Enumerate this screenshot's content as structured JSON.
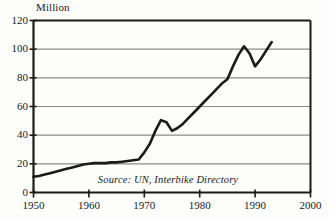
{
  "chart_data": {
    "type": "line",
    "title": "",
    "subtitle": "",
    "xlabel": "",
    "ylabel": "Million",
    "unit_label": "Million",
    "xlim": [
      1950,
      2000
    ],
    "ylim": [
      0,
      120
    ],
    "grid": true,
    "gridlines": "horizontal",
    "legend": "none",
    "legend_position": "none",
    "x_ticks": [
      "1950",
      "1960",
      "1970",
      "1980",
      "1990",
      "2000"
    ],
    "x_tick_values": [
      1950,
      1960,
      1970,
      1980,
      1990,
      2000
    ],
    "y_ticks": [
      "0",
      "20",
      "40",
      "60",
      "80",
      "100",
      "120"
    ],
    "y_tick_values": [
      0,
      20,
      40,
      60,
      80,
      100,
      120
    ],
    "annotations": [
      {
        "name": "source-note",
        "text": "Source: UN, Interbike Directory",
        "x": 1977.5,
        "y": 8
      }
    ],
    "series": [
      {
        "name": "World Bicycle Production",
        "color": "#1a1a1a",
        "x": [
          1950,
          1951,
          1952,
          1953,
          1954,
          1955,
          1956,
          1957,
          1958,
          1959,
          1960,
          1961,
          1962,
          1963,
          1964,
          1965,
          1966,
          1967,
          1968,
          1969,
          1970,
          1971,
          1972,
          1973,
          1974,
          1975,
          1976,
          1977,
          1978,
          1979,
          1980,
          1981,
          1982,
          1983,
          1984,
          1985,
          1986,
          1987,
          1988,
          1989,
          1990,
          1991,
          1992,
          1993
        ],
        "values": [
          11,
          11.5,
          12.5,
          13.5,
          14.5,
          15.5,
          16.5,
          17.5,
          18.5,
          19.5,
          20,
          20.5,
          20.5,
          20.5,
          21,
          21,
          21.5,
          22,
          22.5,
          23,
          28,
          34,
          43,
          50.5,
          49,
          43,
          45,
          48,
          52,
          56,
          60,
          64,
          68,
          72,
          76,
          79,
          88,
          96,
          102,
          97,
          88,
          93,
          99,
          105
        ]
      }
    ]
  },
  "axes": {
    "y_axis_name": "y-axis",
    "x_axis_name": "x-axis",
    "frame_color": "#1a1a1a",
    "grid_color": "#8a8a8a"
  },
  "colors": {
    "line": "#1a1a1a",
    "grid": "#8a8a8a",
    "frame": "#1a1a1a",
    "background": "#fdfdfc",
    "text": "#1b1b1b"
  }
}
